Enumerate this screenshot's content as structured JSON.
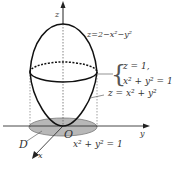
{
  "diagram": {
    "axes": {
      "z": "z",
      "y": "y",
      "x": "x",
      "origin": "O"
    },
    "labels": {
      "upper_surface": "z=2−x²−y²",
      "intersection_line1": "z = 1,",
      "intersection_line2": "x² + y² = 1",
      "lower_surface": "z = x² + y²",
      "region": "D",
      "region_boundary": "x² + y² = 1"
    },
    "colors": {
      "stroke": "#222222",
      "dashed": "#666666",
      "region_fill": "#b8b8b8"
    }
  }
}
